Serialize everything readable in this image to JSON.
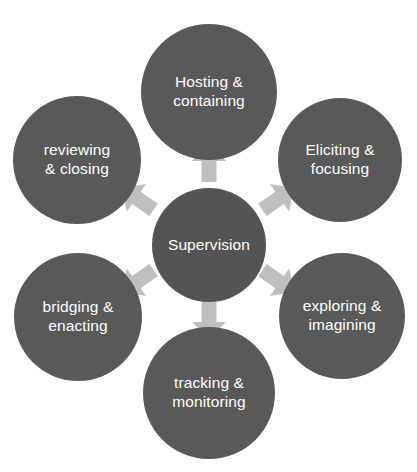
{
  "diagram": {
    "type": "radial-cycle",
    "title": "Supervision",
    "background_color": "#ffffff",
    "node_color": "#595959",
    "hub_color": "#545454",
    "node_text_color": "#ffffff",
    "arrow_color": "#bfbfbf",
    "hub": {
      "label": "Supervision",
      "center_x": 209,
      "center_y": 245,
      "diameter": 114
    },
    "satellites": [
      {
        "id": "hosting-containing",
        "label": "Hosting &\ncontaining",
        "line1": "Hosting &",
        "line2": "containing",
        "center_x": 209,
        "center_y": 92,
        "diameter": 136,
        "position": "top"
      },
      {
        "id": "eliciting-focusing",
        "label": "Eliciting &\nfocusing",
        "line1": "Eliciting &",
        "line2": "focusing",
        "center_x": 340,
        "center_y": 160,
        "diameter": 124,
        "position": "top-right"
      },
      {
        "id": "exploring-imagining",
        "label": "exploring &\nimagining",
        "line1": "exploring &",
        "line2": "imagining",
        "center_x": 342,
        "center_y": 316,
        "diameter": 126,
        "position": "bottom-right"
      },
      {
        "id": "tracking-monitoring",
        "label": "tracking &\nmonitoring",
        "line1": "tracking &",
        "line2": "monitoring",
        "center_x": 209,
        "center_y": 393,
        "diameter": 132,
        "position": "bottom"
      },
      {
        "id": "bridging-enacting",
        "label": "bridging &\nenacting",
        "line1": "bridging &",
        "line2": "enacting",
        "center_x": 78,
        "center_y": 317,
        "diameter": 128,
        "position": "bottom-left"
      },
      {
        "id": "reviewing-closing",
        "label": "reviewing\n& closing",
        "line1": "reviewing",
        "line2": "& closing",
        "center_x": 77,
        "center_y": 160,
        "diameter": 128,
        "position": "top-left"
      }
    ],
    "arrows": [
      {
        "id": "arrow-up",
        "direction": "up",
        "angle_deg": 0,
        "target": "hosting-containing",
        "center_x": 209,
        "center_y": 163
      },
      {
        "id": "arrow-up-right",
        "direction": "up-right",
        "angle_deg": 55,
        "target": "eliciting-focusing",
        "center_x": 278,
        "center_y": 199
      },
      {
        "id": "arrow-down-right",
        "direction": "down-right",
        "angle_deg": 125,
        "target": "exploring-imagining",
        "center_x": 278,
        "center_y": 281
      },
      {
        "id": "arrow-down",
        "direction": "down",
        "angle_deg": 180,
        "target": "tracking-monitoring",
        "center_x": 209,
        "center_y": 320
      },
      {
        "id": "arrow-down-left",
        "direction": "down-left",
        "angle_deg": 235,
        "target": "bridging-enacting",
        "center_x": 138,
        "center_y": 281
      },
      {
        "id": "arrow-up-left",
        "direction": "up-left",
        "angle_deg": 305,
        "target": "reviewing-closing",
        "center_x": 138,
        "center_y": 199
      }
    ]
  }
}
